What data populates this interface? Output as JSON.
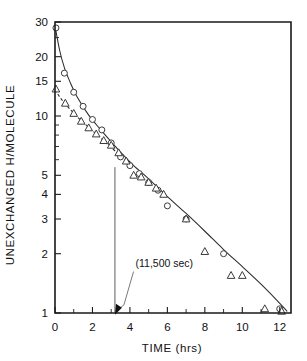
{
  "chart_data": {
    "type": "line",
    "title": "",
    "xlabel": "TIME (hrs)",
    "ylabel": "UNEXCHANGED H/MOLECULE",
    "yscale": "log",
    "xlim": [
      0,
      12.6
    ],
    "ylim": [
      1,
      30
    ],
    "grid": false,
    "legend": "none",
    "xticks": [
      0,
      2,
      4,
      6,
      8,
      10,
      12
    ],
    "xticklabels": [
      "0",
      "2",
      "4",
      "6",
      "8",
      "10",
      "12"
    ],
    "xminorticks": [
      1,
      3,
      5,
      7,
      9,
      11
    ],
    "yticks": [
      1,
      2,
      3,
      4,
      5,
      10,
      15,
      20,
      30
    ],
    "yticklabels": [
      "1",
      "2",
      "3",
      "4",
      "5",
      "10",
      "15",
      "20",
      "30"
    ],
    "yminorticks": [
      6,
      7,
      8,
      9,
      25
    ],
    "series": [
      {
        "name": "circles",
        "marker": "circle",
        "linestyle": "solid",
        "x": [
          0.05,
          0.5,
          1.0,
          1.5,
          2.0,
          2.5,
          3.0,
          3.5,
          4.0,
          4.5,
          5.0,
          5.5,
          6.0,
          7.0,
          9.0,
          12.0
        ],
        "y": [
          28.0,
          16.5,
          13.2,
          11.2,
          9.6,
          8.5,
          7.3,
          6.2,
          5.6,
          5.1,
          4.6,
          4.2,
          3.5,
          3.0,
          2.0,
          1.05
        ]
      },
      {
        "name": "triangles",
        "marker": "triangle",
        "linestyle": "dashed",
        "x": [
          0.05,
          0.55,
          1.0,
          1.4,
          1.8,
          2.2,
          2.6,
          3.0,
          3.4,
          3.8,
          4.2,
          4.6,
          5.0,
          5.4,
          5.8,
          7.0,
          8.0,
          9.4,
          10.0,
          11.2,
          12.1
        ],
        "y": [
          13.7,
          11.6,
          10.3,
          9.4,
          8.7,
          8.1,
          7.5,
          7.1,
          6.5,
          5.9,
          5.0,
          4.9,
          4.6,
          4.3,
          4.0,
          3.0,
          2.05,
          1.55,
          1.55,
          1.05,
          1.02
        ]
      }
    ],
    "fit_curves": [
      {
        "name": "circle-fit",
        "linestyle": "solid",
        "x": [
          0.0,
          0.25,
          0.5,
          0.8,
          1.2,
          1.8,
          2.4,
          3.0,
          3.6,
          4.2,
          5.0,
          6.0,
          7.0,
          8.0,
          9.0,
          10.0,
          11.0,
          12.0,
          12.4
        ],
        "y": [
          28.6,
          21.5,
          17.6,
          14.9,
          12.4,
          10.1,
          8.6,
          7.4,
          6.4,
          5.6,
          4.8,
          3.9,
          3.2,
          2.6,
          2.1,
          1.72,
          1.4,
          1.12,
          1.02
        ]
      },
      {
        "name": "triangle-fit",
        "linestyle": "dashed",
        "x": [
          0.0,
          0.3,
          0.7,
          1.1,
          1.6,
          2.2,
          2.8,
          3.4,
          4.0
        ],
        "y": [
          13.6,
          12.3,
          11.1,
          10.1,
          9.1,
          8.1,
          7.2,
          6.4,
          5.7
        ]
      }
    ],
    "reference_line": {
      "name": "vertical-marker",
      "x": 3.2,
      "y_top": 5.5,
      "y_bottom": 1.0
    },
    "annotation": {
      "text": "(11,500 sec)",
      "x": 4.3,
      "y": 1.72,
      "arrow_to_x": 3.2,
      "arrow_to_y": 1.05
    }
  }
}
